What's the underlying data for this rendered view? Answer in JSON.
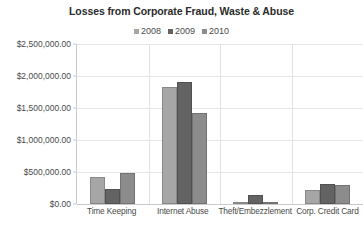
{
  "chart_data": {
    "type": "bar",
    "title": "Losses from Corporate Fraud, Waste & Abuse",
    "subtitle": "",
    "xlabel": "",
    "ylabel": "",
    "categories": [
      "Time Keeping",
      "Internet Abuse",
      "Theft/Embezzlement",
      "Corp. Credit Card"
    ],
    "series": [
      {
        "name": "2008",
        "color": "#a6a6a6",
        "values": [
          420000,
          1830000,
          20000,
          220000
        ]
      },
      {
        "name": "2009",
        "color": "#636363",
        "values": [
          240000,
          1900000,
          140000,
          320000
        ]
      },
      {
        "name": "2010",
        "color": "#8c8c8c",
        "values": [
          480000,
          1420000,
          20000,
          300000
        ]
      }
    ],
    "ylim": [
      0,
      2500000
    ],
    "ytick_step": 500000,
    "ytick_labels": [
      "$2,500,000.00",
      "$2,000,000.00",
      "$1,500,000.00",
      "$1,000,000.00",
      "$500,000.00",
      "$0.00"
    ],
    "ytick_values": [
      2500000,
      2000000,
      1500000,
      1000000,
      500000,
      0
    ],
    "grid": true,
    "grid_color": "#e6e6e6",
    "axis_color": "#c9c9c9",
    "legend_position": "top",
    "background": "#ffffff"
  }
}
